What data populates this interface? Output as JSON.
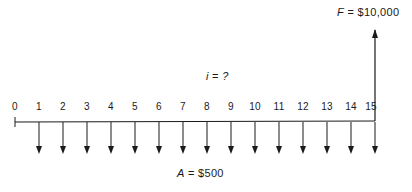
{
  "diagram": {
    "type": "cash-flow-diagram",
    "periods": [
      0,
      1,
      2,
      3,
      4,
      5,
      6,
      7,
      8,
      9,
      10,
      11,
      12,
      13,
      14,
      15
    ],
    "future_value": {
      "symbol": "F",
      "equals": "=",
      "amount": "$10,000",
      "period": 15,
      "direction": "up"
    },
    "interest": {
      "symbol": "i",
      "equals": "=",
      "value": "?"
    },
    "annuity": {
      "symbol": "A",
      "equals": "=",
      "amount": "$500",
      "periods": "1-15",
      "direction": "down"
    },
    "line_color": "#1a1a1a"
  }
}
